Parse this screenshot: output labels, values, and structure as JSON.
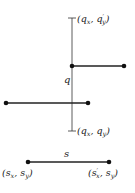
{
  "diagram": {
    "vertical_segment": {
      "name": "q",
      "label": "q",
      "top_label": "(qₓ, q′ᵧ)",
      "bottom_label": "(qₓ, qᵧ)",
      "top_label_parts": {
        "open": "(q",
        "sub1": "x",
        "mid": ", q",
        "prime": "′",
        "sub2": "y",
        "close": ")"
      },
      "bottom_label_parts": {
        "open": "(q",
        "sub1": "x",
        "mid": ", q",
        "sub2": "y",
        "close": ")"
      }
    },
    "horizontal_segment": {
      "name": "s",
      "label": "s",
      "left_label_parts": {
        "open": "(s",
        "sub1": "x",
        "mid": ", s",
        "sub2": "y",
        "close": ")"
      },
      "right_label_parts": {
        "open": "(s",
        "prime": "′",
        "sub1": "x",
        "mid": ", s",
        "sub2": "y",
        "close": ")"
      }
    },
    "other_segments": [
      {
        "name": "upper-segment",
        "from": [
          72,
          66
        ],
        "to": [
          124,
          66
        ]
      },
      {
        "name": "lower-segment",
        "from": [
          6,
          103
        ],
        "to": [
          88,
          103
        ]
      }
    ],
    "colors": {
      "line": "#222222",
      "point": "#111111"
    }
  }
}
